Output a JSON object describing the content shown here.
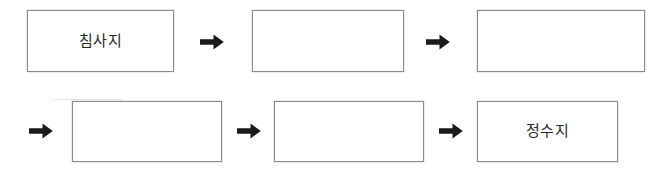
{
  "diagram": {
    "type": "process-flow",
    "title": "",
    "background_color": "#ffffff",
    "box_border_color": "#8a8a8a",
    "text_color": "#27272a",
    "arrow_color": "#1a1a1a",
    "arrow_icon_name": "right-arrow-icon",
    "rows": [
      {
        "row_index": 1,
        "leading_arrow": false,
        "nodes": [
          {
            "id": "node-1",
            "label": "침사지",
            "empty": false
          },
          {
            "id": "node-2",
            "label": "",
            "empty": true
          },
          {
            "id": "node-3",
            "label": "",
            "empty": true
          }
        ]
      },
      {
        "row_index": 2,
        "leading_arrow": true,
        "nodes": [
          {
            "id": "node-4",
            "label": "",
            "empty": true
          },
          {
            "id": "node-5",
            "label": "",
            "empty": true
          },
          {
            "id": "node-6",
            "label": "정수지",
            "empty": false
          }
        ]
      }
    ],
    "arrow_count": 5,
    "node_count": 6
  }
}
